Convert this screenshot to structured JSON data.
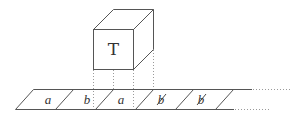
{
  "diagram": {
    "head": {
      "label": "T",
      "shape": "cube"
    },
    "tape": {
      "cells": [
        {
          "symbol": "a",
          "is_blank": false
        },
        {
          "symbol": "b",
          "is_blank": false
        },
        {
          "symbol": "a",
          "is_blank": false
        },
        {
          "symbol": "b",
          "is_blank": true
        },
        {
          "symbol": "b",
          "is_blank": true
        }
      ],
      "continues_right": true
    },
    "colors": {
      "line": "#555555",
      "dotted": "#9a9a9a",
      "text": "#333333",
      "background": "#ffffff"
    }
  }
}
